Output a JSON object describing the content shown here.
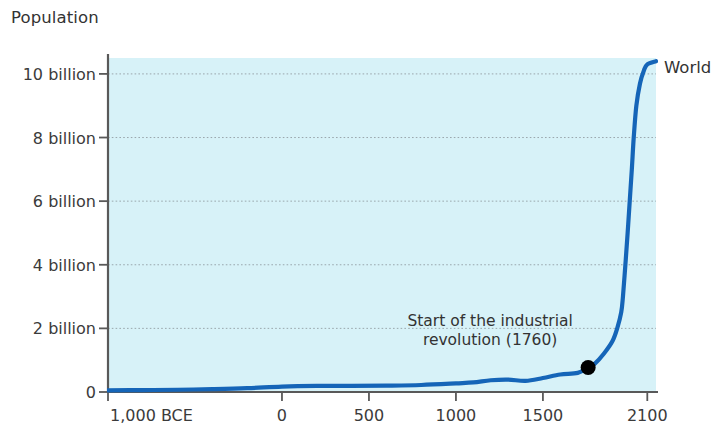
{
  "chart_data": {
    "type": "line",
    "title": "Population",
    "xlabel": "",
    "ylabel": "Population",
    "grid": true,
    "legend_position": "inline-right",
    "xlim": [
      -1000,
      2150
    ],
    "ylim": [
      0,
      10.5
    ],
    "y_unit": "billion",
    "y_ticks": [
      {
        "value": 0,
        "label": "0"
      },
      {
        "value": 2,
        "label": "2 billion"
      },
      {
        "value": 4,
        "label": "4 billion"
      },
      {
        "value": 6,
        "label": "6 billion"
      },
      {
        "value": 8,
        "label": "8 billion"
      },
      {
        "value": 10,
        "label": "10 billion"
      }
    ],
    "x_ticks": [
      {
        "value": -1000,
        "label": "1,000 BCE"
      },
      {
        "value": 0,
        "label": "0"
      },
      {
        "value": 500,
        "label": "500"
      },
      {
        "value": 1000,
        "label": "1000"
      },
      {
        "value": 1500,
        "label": "1500"
      },
      {
        "value": 2100,
        "label": "2100"
      }
    ],
    "series": [
      {
        "name": "World",
        "color": "#1565b8",
        "x": [
          -1000,
          -800,
          -600,
          -400,
          -200,
          0,
          200,
          400,
          600,
          800,
          1000,
          1100,
          1200,
          1300,
          1400,
          1500,
          1600,
          1700,
          1760,
          1800,
          1850,
          1900,
          1927,
          1950,
          1960,
          1974,
          1987,
          1999,
          2011,
          2022,
          2037,
          2058,
          2080,
          2100,
          2150
        ],
        "values": [
          0.05,
          0.06,
          0.07,
          0.09,
          0.12,
          0.17,
          0.19,
          0.19,
          0.2,
          0.22,
          0.27,
          0.3,
          0.37,
          0.39,
          0.35,
          0.44,
          0.55,
          0.6,
          0.77,
          0.9,
          1.2,
          1.6,
          2.0,
          2.5,
          3.0,
          4.0,
          5.0,
          6.0,
          7.0,
          8.0,
          9.0,
          9.7,
          10.1,
          10.3,
          10.4
        ]
      }
    ],
    "annotations": [
      {
        "text": "Start of the industrial\nrevolution (1760)",
        "marker_x": 1760,
        "marker_y": 0.77,
        "marker_color": "#000000"
      }
    ],
    "colors": {
      "plot_background": "#d7f2f8",
      "line": "#1565b8",
      "axis": "#595959",
      "grid": "#8f9aa0",
      "text": "#3a3a3a",
      "page_background": "#ffffff"
    }
  }
}
